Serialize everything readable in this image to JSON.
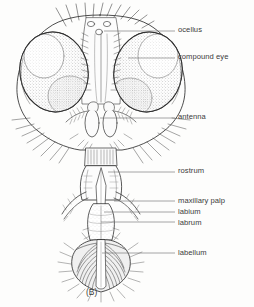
{
  "figure": {
    "caption": "(B)",
    "background_color": "#fdfdfc",
    "ink_color": "#2e2e2e",
    "label_color": "#3b3b3b"
  },
  "labels": [
    {
      "id": "ocellus",
      "text": "ocellus",
      "text_x": 178,
      "text_y": 26,
      "leader_x1": 104,
      "leader_y1": 31,
      "leader_x2": 175,
      "leader_y2": 31
    },
    {
      "id": "compound-eye",
      "text": "compound eye",
      "text_x": 178,
      "text_y": 53,
      "leader_x1": 128,
      "leader_y1": 58,
      "leader_x2": 175,
      "leader_y2": 58
    },
    {
      "id": "antenna",
      "text": "antenna",
      "text_x": 178,
      "text_y": 113,
      "leader_x1": 100,
      "leader_y1": 118,
      "leader_x2": 175,
      "leader_y2": 118
    },
    {
      "id": "rostrum",
      "text": "rostrum",
      "text_x": 178,
      "text_y": 167,
      "leader_x1": 108,
      "leader_y1": 172,
      "leader_x2": 175,
      "leader_y2": 172
    },
    {
      "id": "maxillary-palp",
      "text": "maxillary palp",
      "text_x": 178,
      "text_y": 197,
      "leader_x1": 114,
      "leader_y1": 201,
      "leader_x2": 175,
      "leader_y2": 201
    },
    {
      "id": "labium",
      "text": "labium",
      "text_x": 178,
      "text_y": 208,
      "leader_x1": 104,
      "leader_y1": 212,
      "leader_x2": 175,
      "leader_y2": 212
    },
    {
      "id": "labrum",
      "text": "labrum",
      "text_x": 178,
      "text_y": 219,
      "leader_x1": 101,
      "leader_y1": 222,
      "leader_x2": 175,
      "leader_y2": 222
    },
    {
      "id": "labellum",
      "text": "labellum",
      "text_x": 178,
      "text_y": 249,
      "leader_x1": 102,
      "leader_y1": 253,
      "leader_x2": 175,
      "leader_y2": 253
    }
  ],
  "anatomy_parts": [
    "ocellus",
    "compound eye",
    "antenna",
    "rostrum",
    "maxillary palp",
    "labium",
    "labrum",
    "labellum"
  ]
}
